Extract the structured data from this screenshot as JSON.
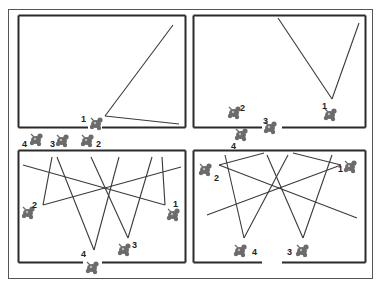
{
  "figure": {
    "outer_frame": {
      "x": 8,
      "y": 9,
      "w": 364,
      "h": 269
    },
    "colors": {
      "frame": "#555555",
      "panel_border": "#2a2a2a",
      "line": "#3a3a3a",
      "figure": "#6b6b6b",
      "label": "#222222"
    },
    "panels": [
      {
        "id": "panel-top-left",
        "rect": {
          "x": 18,
          "y": 15,
          "w": 167,
          "h": 112
        },
        "gap": {
          "edge": "bottom",
          "from": 88,
          "to": 102
        },
        "beams": [
          {
            "x1": 105,
            "y1": 116,
            "x2": 173,
            "y2": 25
          },
          {
            "x1": 105,
            "y1": 116,
            "x2": 179,
            "y2": 124
          }
        ],
        "figures": [
          {
            "label": "1",
            "x": 96,
            "y": 124,
            "lx": 81,
            "ly": 122
          },
          {
            "label": "2",
            "x": 87,
            "y": 141,
            "lx": 96,
            "ly": 147
          },
          {
            "label": "3",
            "x": 62,
            "y": 141,
            "lx": 50,
            "ly": 147
          },
          {
            "label": "4",
            "x": 36,
            "y": 140,
            "lx": 22,
            "ly": 147
          }
        ]
      },
      {
        "id": "panel-top-right",
        "rect": {
          "x": 193,
          "y": 15,
          "w": 172,
          "h": 112
        },
        "gap": {
          "edge": "bottom",
          "from": 262,
          "to": 282
        },
        "beams": [
          {
            "x1": 332,
            "y1": 99,
            "x2": 278,
            "y2": 18
          },
          {
            "x1": 332,
            "y1": 99,
            "x2": 359,
            "y2": 23
          }
        ],
        "figures": [
          {
            "label": "1",
            "x": 330,
            "y": 115,
            "lx": 322,
            "ly": 109
          },
          {
            "label": "2",
            "x": 234,
            "y": 113,
            "lx": 240,
            "ly": 111
          },
          {
            "label": "3",
            "x": 270,
            "y": 128,
            "lx": 263,
            "ly": 124
          },
          {
            "label": "4",
            "x": 241,
            "y": 135,
            "lx": 231,
            "ly": 149
          }
        ]
      },
      {
        "id": "panel-bottom-left",
        "rect": {
          "x": 18,
          "y": 150,
          "w": 167,
          "h": 112
        },
        "gap": {
          "edge": "bottom",
          "from": 83,
          "to": 102
        },
        "beams": [
          {
            "x1": 43,
            "y1": 205,
            "x2": 52,
            "y2": 157
          },
          {
            "x1": 43,
            "y1": 205,
            "x2": 181,
            "y2": 167
          },
          {
            "x1": 165,
            "y1": 205,
            "x2": 162,
            "y2": 157
          },
          {
            "x1": 165,
            "y1": 205,
            "x2": 23,
            "y2": 165
          },
          {
            "x1": 94,
            "y1": 250,
            "x2": 57,
            "y2": 157
          },
          {
            "x1": 94,
            "y1": 250,
            "x2": 119,
            "y2": 157
          },
          {
            "x1": 128,
            "y1": 238,
            "x2": 91,
            "y2": 157
          },
          {
            "x1": 128,
            "y1": 238,
            "x2": 152,
            "y2": 157
          }
        ],
        "figures": [
          {
            "label": "1",
            "x": 173,
            "y": 215,
            "lx": 173,
            "ly": 207
          },
          {
            "label": "2",
            "x": 28,
            "y": 213,
            "lx": 32,
            "ly": 208
          },
          {
            "label": "3",
            "x": 124,
            "y": 250,
            "lx": 132,
            "ly": 248
          },
          {
            "label": "4",
            "x": 92,
            "y": 268,
            "lx": 81,
            "ly": 257
          }
        ]
      },
      {
        "id": "panel-bottom-right",
        "rect": {
          "x": 193,
          "y": 150,
          "w": 172,
          "h": 112
        },
        "gap": {
          "edge": "bottom",
          "from": 262,
          "to": 282
        },
        "beams": [
          {
            "x1": 219,
            "y1": 165,
            "x2": 264,
            "y2": 153
          },
          {
            "x1": 219,
            "y1": 165,
            "x2": 357,
            "y2": 218
          },
          {
            "x1": 341,
            "y1": 165,
            "x2": 293,
            "y2": 153
          },
          {
            "x1": 341,
            "y1": 165,
            "x2": 207,
            "y2": 215
          },
          {
            "x1": 244,
            "y1": 238,
            "x2": 225,
            "y2": 155
          },
          {
            "x1": 244,
            "y1": 238,
            "x2": 288,
            "y2": 155
          },
          {
            "x1": 303,
            "y1": 238,
            "x2": 267,
            "y2": 155
          },
          {
            "x1": 303,
            "y1": 238,
            "x2": 332,
            "y2": 155
          }
        ],
        "figures": [
          {
            "label": "1",
            "x": 350,
            "y": 167,
            "lx": 338,
            "ly": 172
          },
          {
            "label": "2",
            "x": 205,
            "y": 170,
            "lx": 214,
            "ly": 181
          },
          {
            "label": "3",
            "x": 302,
            "y": 251,
            "lx": 287,
            "ly": 255
          },
          {
            "label": "4",
            "x": 240,
            "y": 251,
            "lx": 252,
            "ly": 255
          }
        ]
      }
    ]
  }
}
